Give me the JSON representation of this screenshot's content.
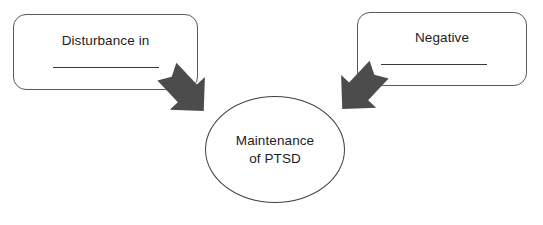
{
  "diagram": {
    "colors": {
      "arrow_fill": "#4c4c4c",
      "outline": "#5a5a5a",
      "text": "#1c1c1c",
      "background": "#ffffff"
    },
    "boxes": [
      {
        "id": "left",
        "label": "Disturbance in",
        "blank_underline": true
      },
      {
        "id": "right",
        "label": "Negative",
        "blank_underline": true
      }
    ],
    "center_node": {
      "label_line_1": "Maintenance",
      "label_line_2": "of PTSD"
    },
    "arrows": [
      {
        "id": "left-arrow",
        "direction": "down-right",
        "from": "left-box",
        "to": "center-node"
      },
      {
        "id": "right-arrow",
        "direction": "down-left",
        "from": "right-box",
        "to": "center-node"
      }
    ]
  }
}
